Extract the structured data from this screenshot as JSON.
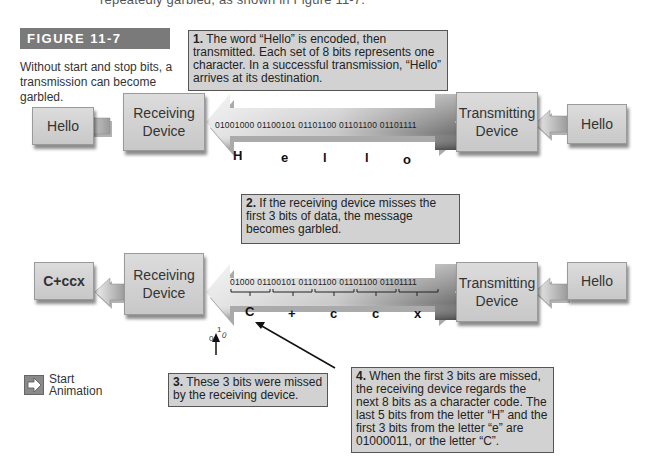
{
  "top_text": "repeatedly garbled, as shown in Figure 11-7.",
  "figure": {
    "label": "FIGURE 11-7",
    "caption": "Without start and stop bits, a transmission can become garbled."
  },
  "notes": {
    "n1": {
      "num": "1.",
      "text": " The word “Hello” is encoded, then transmitted. Each set of 8 bits represents one character. In a successful transmission, “Hello” arrives at its destination."
    },
    "n2": {
      "num": "2.",
      "text": " If the receiving device misses the first 3 bits of data, the message becomes garbled."
    },
    "n3": {
      "num": "3.",
      "text": " These 3 bits were missed by the receiving device."
    },
    "n4": {
      "num": "4.",
      "text": " When the first 3 bits are missed, the receiving device regards the next 8 bits as a character code. The last 5 bits from the letter “H” and the first 3 bits from the letter “e” are 01000011, or the letter “C”."
    }
  },
  "row1": {
    "output": "Hello",
    "receiver": {
      "line1": "Receiving",
      "line2": "Device"
    },
    "bits": "01001000 01100101 01101100 01101100 01101111",
    "letters": [
      "H",
      "e",
      "l",
      "l",
      "o"
    ],
    "transmitter": {
      "line1": "Transmitting",
      "line2": "Device"
    },
    "input": "Hello"
  },
  "row2": {
    "output": "C+ccx",
    "receiver": {
      "line1": "Receiving",
      "line2": "Device"
    },
    "bits": "01000 01100101 01101100 01101100 01101111",
    "letters": [
      "C",
      "+",
      "c",
      "c",
      "x"
    ],
    "missed_bits": [
      "0",
      "1",
      "0"
    ],
    "transmitter": {
      "line1": "Transmitting",
      "line2": "Device"
    },
    "input": "Hello"
  },
  "start_animation": {
    "line1": "Start",
    "line2": "Animation"
  },
  "colors": {
    "figure_label_bg": "#7a7a7a",
    "note_bg": "#d2d2d2",
    "box_bg": "#d0d0d0"
  }
}
